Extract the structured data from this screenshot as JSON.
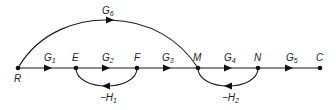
{
  "diagram": {
    "type": "signal-flow-graph",
    "nodes": [
      {
        "id": "R",
        "label": "R"
      },
      {
        "id": "E",
        "label": "E"
      },
      {
        "id": "F",
        "label": "F"
      },
      {
        "id": "M",
        "label": "M"
      },
      {
        "id": "N",
        "label": "N"
      },
      {
        "id": "C",
        "label": "C"
      }
    ],
    "edges": [
      {
        "from": "R",
        "to": "E",
        "gain": "G",
        "sub": "1"
      },
      {
        "from": "E",
        "to": "F",
        "gain": "G",
        "sub": "2"
      },
      {
        "from": "F",
        "to": "M",
        "gain": "G",
        "sub": "3"
      },
      {
        "from": "M",
        "to": "N",
        "gain": "G",
        "sub": "4"
      },
      {
        "from": "N",
        "to": "C",
        "gain": "G",
        "sub": "5"
      },
      {
        "from": "R",
        "to": "M",
        "gain": "G",
        "sub": "6"
      },
      {
        "from": "F",
        "to": "E",
        "gain": "−H",
        "sub": "1"
      },
      {
        "from": "N",
        "to": "M",
        "gain": "−H",
        "sub": "2"
      }
    ]
  }
}
